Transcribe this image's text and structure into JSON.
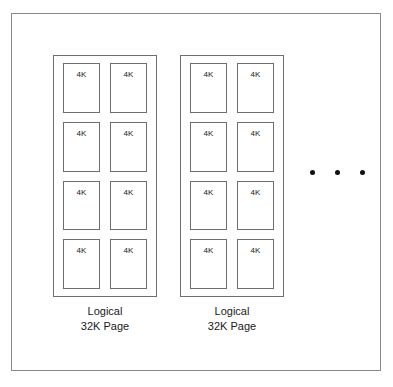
{
  "diagram": {
    "type": "block-diagram",
    "colors": {
      "background": "#ffffff",
      "outer_border": "#8a8a8a",
      "group_border": "#6e6e6e",
      "cell_border": "#6e6e6e",
      "text": "#1a1a1a",
      "dot": "#111111"
    },
    "groups": [
      {
        "id": "logical-page-1",
        "caption_line_1": "Logical",
        "caption_line_2": "32K Page",
        "cells": [
          {
            "label": "4K"
          },
          {
            "label": "4K"
          },
          {
            "label": "4K"
          },
          {
            "label": "4K"
          },
          {
            "label": "4K"
          },
          {
            "label": "4K"
          },
          {
            "label": "4K"
          },
          {
            "label": "4K"
          }
        ]
      },
      {
        "id": "logical-page-2",
        "caption_line_1": "Logical",
        "caption_line_2": "32K Page",
        "cells": [
          {
            "label": "4K"
          },
          {
            "label": "4K"
          },
          {
            "label": "4K"
          },
          {
            "label": "4K"
          },
          {
            "label": "4K"
          },
          {
            "label": "4K"
          },
          {
            "label": "4K"
          },
          {
            "label": "4K"
          }
        ]
      }
    ],
    "continuation": {
      "symbol": "ellipsis",
      "dot_count": 3
    }
  }
}
